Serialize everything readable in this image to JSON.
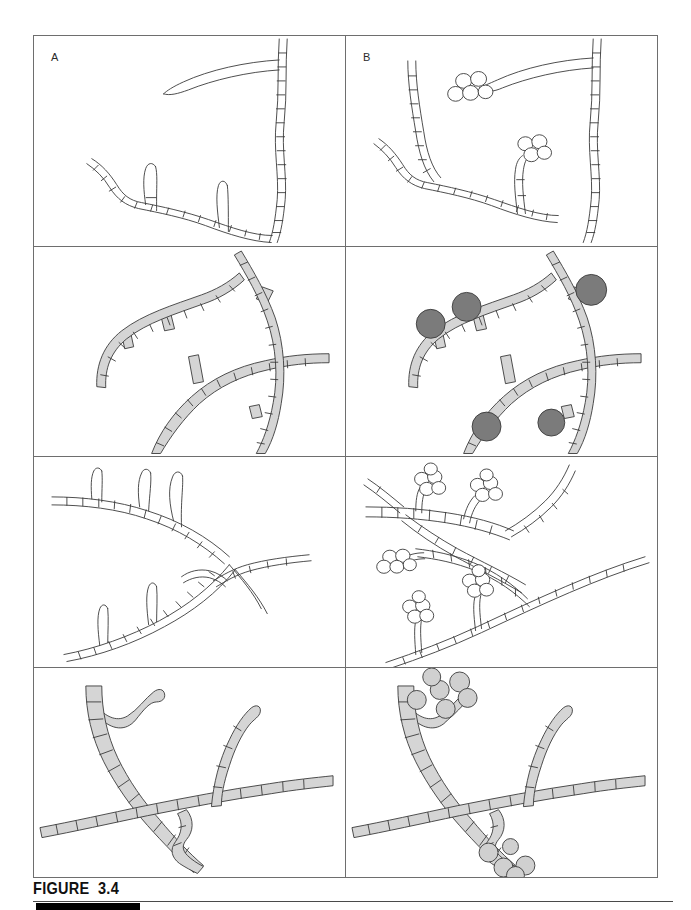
{
  "figure": {
    "caption": "FIGURE  3.4",
    "column_labels": [
      "A",
      "B"
    ],
    "rows": 4,
    "columns": 2
  },
  "colors": {
    "outline": "#3a3a3a",
    "panel_border": "#6e6e6e",
    "hypha_light_fill": "#d5d5d5",
    "spore_dark_fill": "#7b7b7b",
    "spore_light_fill": "#d0d0d0",
    "spore_open_fill": "#ffffff",
    "caption_bar": "#000000",
    "page_background": "#ffffff"
  },
  "panels": [
    {
      "id": "panel-1a",
      "row": 1,
      "column": "A",
      "label": "A",
      "style": "outline",
      "subject": "septate-hyphae-vegetative",
      "description": "Unstained septate hyphae drawn in outline with cross-walls; a long sterile tip at upper area and two short lateral pegs on the basal hypha.",
      "spores": 0
    },
    {
      "id": "panel-1b",
      "row": 1,
      "column": "B",
      "label": "B",
      "style": "outline",
      "subject": "septate-hyphae-with-conidial-heads",
      "description": "Same hyphal network bearing two clusters of open-circle conidia at the tips of short conidiophores.",
      "spores": 9
    },
    {
      "id": "panel-2a",
      "row": 2,
      "column": "A",
      "label": "",
      "style": "filled",
      "subject": "grey-septate-hyphae-with-pegs",
      "description": "Three crossing grey-filled septate hyphae with short peg-like lateral branches.",
      "spores": 0
    },
    {
      "id": "panel-2b",
      "row": 2,
      "column": "B",
      "label": "",
      "style": "filled",
      "subject": "grey-septate-hyphae-with-sporangia",
      "description": "Same grey hyphal network bearing five large dark sporangia on short stalks.",
      "spores": 5
    },
    {
      "id": "panel-3a",
      "row": 3,
      "column": "A",
      "label": "",
      "style": "outline",
      "subject": "branched-hyphae-with-conidiophores",
      "description": "Outline septate hyphae with several erect unbranched conidiophore stalks and no spores.",
      "spores": 0
    },
    {
      "id": "panel-3b",
      "row": 3,
      "column": "B",
      "label": "",
      "style": "outline",
      "subject": "branched-hyphae-with-conidia",
      "description": "Same branched hyphae with five clusters of open-circle conidia borne on the erect stalks.",
      "spores": 25
    },
    {
      "id": "panel-4a",
      "row": 4,
      "column": "A",
      "label": "",
      "style": "filled",
      "subject": "crossing-grey-hyphae",
      "description": "Two crossing grey-filled septate hyphae with a short curved lateral branch and an erect branch.",
      "spores": 0
    },
    {
      "id": "panel-4b",
      "row": 4,
      "column": "B",
      "label": "",
      "style": "filled",
      "subject": "crossing-grey-hyphae-with-budding-spores",
      "description": "Same crossing grey hyphae bearing two groups of round grey budding spores.",
      "spores": 11
    }
  ]
}
